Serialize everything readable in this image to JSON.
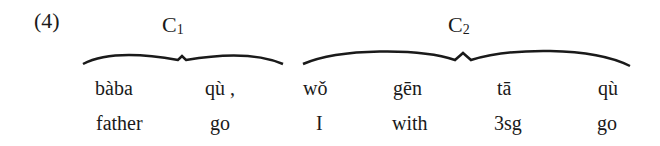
{
  "example": {
    "number": "(4)",
    "clauses": [
      {
        "label": "C",
        "subscript": "1",
        "words": [
          "bàba",
          "qù ,"
        ],
        "glosses": [
          "father",
          "go"
        ]
      },
      {
        "label": "C",
        "subscript": "2",
        "words": [
          "wǒ",
          "gēn",
          "tā",
          "qù"
        ],
        "glosses": [
          "I",
          "with",
          "3sg",
          "go"
        ]
      }
    ]
  }
}
